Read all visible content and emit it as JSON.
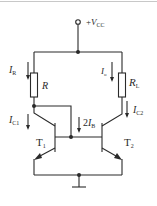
{
  "diagram": {
    "type": "circuit",
    "supply": {
      "label_prefix": "+",
      "label_main": "V",
      "label_sub": "CC"
    },
    "components": {
      "resistor_ref": {
        "label": "R"
      },
      "resistor_load": {
        "label_main": "R",
        "label_sub": "L"
      },
      "transistor_1": {
        "label_main": "T",
        "label_sub": "1"
      },
      "transistor_2": {
        "label_main": "T",
        "label_sub": "2"
      }
    },
    "currents": {
      "i_r": {
        "main": "I",
        "sub": "R"
      },
      "i_o": {
        "main": "I",
        "sub": "o"
      },
      "i_c1": {
        "main": "I",
        "sub": "C1"
      },
      "i_c2": {
        "main": "I",
        "sub": "C2"
      },
      "i_b": {
        "prefix": "2",
        "main": "I",
        "sub": "B"
      }
    },
    "colors": {
      "line": "#2a2a2a",
      "background": "#ffffff",
      "border": "#c8c8c8"
    }
  }
}
